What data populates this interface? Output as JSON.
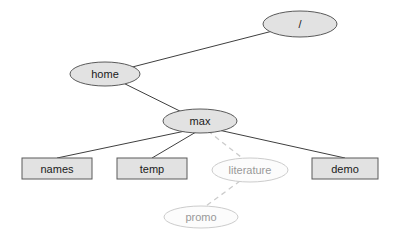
{
  "diagram": {
    "type": "tree",
    "canvas": {
      "width": 400,
      "height": 237,
      "background": "#ffffff"
    },
    "styles": {
      "node_fill": "#e2e2e2",
      "node_stroke": "#5a5a5a",
      "node_text_color": "#1a1a1a",
      "ghost_fill": "#fcfcfc",
      "ghost_stroke": "#cccccc",
      "ghost_text_color": "#999999",
      "edge_solid_color": "#3f3f3f",
      "edge_dashed_color": "#cccccc",
      "font_size": 11
    },
    "nodes": [
      {
        "id": "root",
        "label": "/",
        "shape": "ellipse",
        "variant": "solid",
        "cx": 300,
        "cy": 24,
        "rx": 37,
        "ry": 13
      },
      {
        "id": "home",
        "label": "home",
        "shape": "ellipse",
        "variant": "solid",
        "cx": 105,
        "cy": 74,
        "rx": 35,
        "ry": 12
      },
      {
        "id": "max",
        "label": "max",
        "shape": "ellipse",
        "variant": "solid",
        "cx": 200,
        "cy": 121,
        "rx": 37,
        "ry": 12
      },
      {
        "id": "names",
        "label": "names",
        "shape": "rect",
        "variant": "solid",
        "x": 22,
        "y": 158,
        "w": 70,
        "h": 21
      },
      {
        "id": "temp",
        "label": "temp",
        "shape": "rect",
        "variant": "solid",
        "x": 117,
        "y": 158,
        "w": 70,
        "h": 21
      },
      {
        "id": "literature",
        "label": "literature",
        "shape": "ellipse",
        "variant": "ghost",
        "cx": 250,
        "cy": 170,
        "rx": 38,
        "ry": 12
      },
      {
        "id": "demo",
        "label": "demo",
        "shape": "rect",
        "variant": "solid",
        "x": 312,
        "y": 158,
        "w": 66,
        "h": 21
      },
      {
        "id": "promo",
        "label": "promo",
        "shape": "ellipse",
        "variant": "ghost",
        "cx": 201,
        "cy": 217,
        "rx": 37,
        "ry": 11
      }
    ],
    "edges": [
      {
        "from": "home",
        "to": "root",
        "style": "solid",
        "x1": 105,
        "y1": 74,
        "x2": 300,
        "y2": 24
      },
      {
        "from": "home",
        "to": "max",
        "style": "solid",
        "x1": 105,
        "y1": 74,
        "x2": 200,
        "y2": 121
      },
      {
        "from": "max",
        "to": "names",
        "style": "solid",
        "x1": 190,
        "y1": 130,
        "x2": 57,
        "y2": 158
      },
      {
        "from": "max",
        "to": "temp",
        "style": "solid",
        "x1": 196,
        "y1": 132,
        "x2": 152,
        "y2": 158
      },
      {
        "from": "max",
        "to": "literature",
        "style": "dashed",
        "x1": 208,
        "y1": 131,
        "x2": 241,
        "y2": 157
      },
      {
        "from": "max",
        "to": "demo",
        "style": "solid",
        "x1": 214,
        "y1": 129,
        "x2": 345,
        "y2": 158
      },
      {
        "from": "literature",
        "to": "promo",
        "style": "dashed",
        "x1": 240,
        "y1": 181,
        "x2": 206,
        "y2": 206
      }
    ]
  }
}
